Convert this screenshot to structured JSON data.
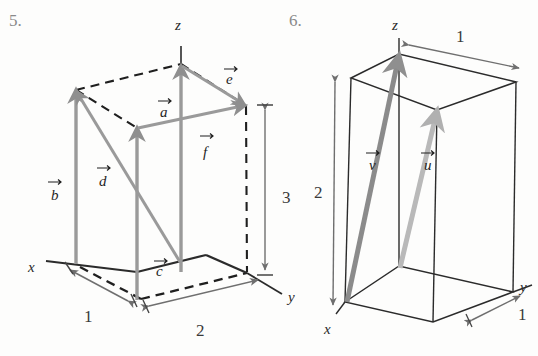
{
  "page": {
    "background_color": "#fdfdfc",
    "width": 538,
    "height": 356
  },
  "figures": [
    {
      "id": "figure-5",
      "number_label": "5.",
      "axes": [
        {
          "name": "x",
          "label": "x"
        },
        {
          "name": "y",
          "label": "y"
        },
        {
          "name": "z",
          "label": "z"
        }
      ],
      "vectors": [
        {
          "name": "a",
          "label": "a"
        },
        {
          "name": "b",
          "label": "b"
        },
        {
          "name": "c",
          "label": "c"
        },
        {
          "name": "d",
          "label": "d"
        },
        {
          "name": "e",
          "label": "e"
        },
        {
          "name": "f",
          "label": "f"
        }
      ],
      "dimensions": [
        {
          "name": "x-depth",
          "label": "1"
        },
        {
          "name": "y-width",
          "label": "2"
        },
        {
          "name": "z-height",
          "label": "3"
        }
      ],
      "colors": {
        "vector": "#9a9a9a",
        "solid_edge": "#2b2b2b",
        "dashed_edge": "#1f1f1f",
        "dimension": "#6f6f6f"
      }
    },
    {
      "id": "figure-6",
      "number_label": "6.",
      "axes": [
        {
          "name": "x",
          "label": "x"
        },
        {
          "name": "y",
          "label": "y"
        },
        {
          "name": "z",
          "label": "z"
        }
      ],
      "vectors": [
        {
          "name": "v",
          "label": "v"
        },
        {
          "name": "u",
          "label": "u"
        }
      ],
      "dimensions": [
        {
          "name": "y-width-top",
          "label": "1"
        },
        {
          "name": "z-height",
          "label": "2"
        },
        {
          "name": "x-depth",
          "label": "1"
        }
      ],
      "colors": {
        "vector_v": "#8b8b8b",
        "vector_u": "#b9b9b9",
        "edge": "#2b2b2b",
        "dimension": "#6f6f6f"
      }
    }
  ],
  "vector_arrow_accent": "→"
}
